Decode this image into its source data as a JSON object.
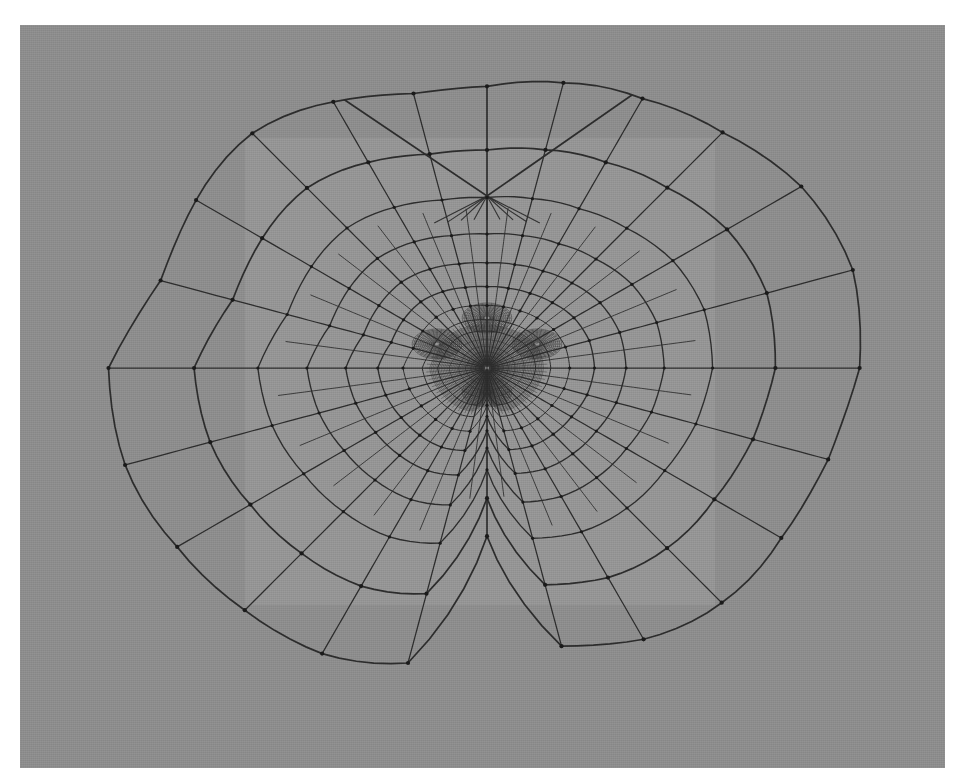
{
  "view": {
    "title": "3D Mesh Wireframe Viewport",
    "renderer_label": "wireframe-shaded",
    "background_color": "#8d8d8d",
    "panel_color": "#a0a0a0",
    "wire_color": "#2c2c2c",
    "vertex_color": "#1a1a1a",
    "canvas": {
      "x": 20,
      "y": 25,
      "width": 925,
      "height": 743
    }
  },
  "backdrop_panel": {
    "name": "light-rectangular-backdrop",
    "x": 245,
    "y": 138,
    "width": 470,
    "height": 467,
    "color": "#a3a3a3",
    "opacity": 0.38
  },
  "mesh": {
    "name": "radial-quad-face-mesh",
    "topology": "quad",
    "symmetry": "bilateral-vertical",
    "center": {
      "x": 487,
      "y": 368
    },
    "ring_count": 16,
    "spoke_count": 24,
    "refinement": "extreme-at-center",
    "silhouette_bounds": {
      "left": 100,
      "right": 868,
      "top": 126,
      "bottom": 712
    },
    "top_notch": {
      "x": 487,
      "y": 196,
      "label": "v-notch-top-center"
    },
    "features": [
      {
        "name": "left-eye-cluster",
        "x": 437,
        "y": 344
      },
      {
        "name": "right-eye-cluster",
        "x": 537,
        "y": 344
      },
      {
        "name": "nose-cluster",
        "x": 487,
        "y": 392
      },
      {
        "name": "brow-ridge",
        "x": 487,
        "y": 318
      }
    ],
    "line_widths": {
      "outer": 1.7,
      "mid": 1.35,
      "inner": 1.0,
      "dense": 0.6
    }
  },
  "chart_data": {
    "type": "scatter",
    "xlabel": "",
    "ylabel": "",
    "note": "Mesh ring radii are expressed as a fraction of the outer silhouette radius; density rises sharply toward the center.",
    "ring_radius_fractions": [
      0.012,
      0.02,
      0.03,
      0.042,
      0.056,
      0.074,
      0.098,
      0.128,
      0.168,
      0.218,
      0.284,
      0.368,
      0.47,
      0.6,
      0.77,
      1.0
    ],
    "spoke_angles_deg": [
      0,
      15,
      30,
      45,
      60,
      75,
      90,
      105,
      120,
      135,
      150,
      165,
      180,
      195,
      210,
      225,
      240,
      255,
      270,
      285,
      300,
      315,
      330,
      345
    ],
    "silhouette_radius_by_angle": {
      "angles_deg": [
        0,
        15,
        30,
        45,
        60,
        75,
        90,
        105,
        120,
        135,
        150,
        165,
        180,
        195,
        210,
        225,
        240,
        255,
        270,
        285,
        300,
        315,
        330,
        345
      ],
      "radius_px": [
        381,
        372,
        350,
        321,
        300,
        290,
        288,
        296,
        312,
        330,
        341,
        352,
        387,
        368,
        345,
        330,
        318,
        300,
        172,
        300,
        318,
        330,
        345,
        368
      ]
    }
  }
}
